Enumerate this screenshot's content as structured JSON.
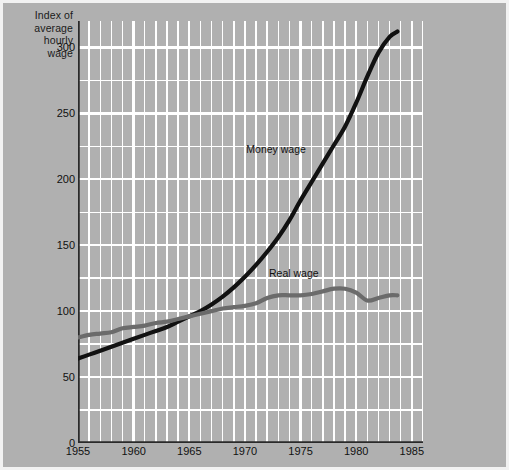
{
  "chart_data": {
    "type": "line",
    "title": "Index of average hourly wage",
    "xlabel": "",
    "ylabel": "Index of average hourly wage",
    "xlim": [
      1955,
      1986
    ],
    "ylim": [
      0,
      320
    ],
    "yticks": [
      0,
      50,
      100,
      150,
      200,
      250,
      300
    ],
    "xticks": [
      1955,
      1960,
      1965,
      1970,
      1975,
      1980,
      1985
    ],
    "grid": true,
    "grid_color": "#ffffff",
    "plot_background": "#b0b0b0",
    "legend": "inline-annotations",
    "annotations": [
      {
        "text": "Money wage",
        "x": 1973.0,
        "y": 222
      },
      {
        "text": "Real wage",
        "x": 1974.5,
        "y": 128
      }
    ],
    "series": [
      {
        "name": "Money wage",
        "color": "#111111",
        "width": 4.2,
        "x": [
          1955,
          1956,
          1957,
          1958,
          1959,
          1960,
          1961,
          1962,
          1963,
          1964,
          1965,
          1966,
          1967,
          1968,
          1969,
          1970,
          1971,
          1972,
          1973,
          1974,
          1975,
          1976,
          1977,
          1978,
          1979,
          1980,
          1981,
          1982,
          1983,
          1983.7
        ],
        "values": [
          64,
          67,
          70,
          73,
          76,
          79,
          82,
          85,
          88,
          92,
          96,
          100,
          105,
          111,
          118,
          126,
          135,
          145,
          156,
          169,
          184,
          198,
          212,
          226,
          240,
          258,
          278,
          296,
          308,
          312
        ]
      },
      {
        "name": "Real wage",
        "color": "#6b6b6b",
        "width": 4.2,
        "x": [
          1955,
          1956,
          1957,
          1958,
          1959,
          1960,
          1961,
          1962,
          1963,
          1964,
          1965,
          1966,
          1967,
          1968,
          1969,
          1970,
          1971,
          1972,
          1973,
          1974,
          1975,
          1976,
          1977,
          1978,
          1979,
          1980,
          1981,
          1982,
          1983,
          1983.7
        ],
        "values": [
          80,
          82,
          83,
          84,
          87,
          88,
          89,
          91,
          92,
          94,
          96,
          98,
          100,
          102,
          103,
          104,
          106,
          110,
          112,
          112,
          112,
          113,
          115,
          117,
          117,
          114,
          108,
          110,
          112,
          112
        ]
      }
    ]
  },
  "axis_title_text": "Index of\naverage\nhourly\nwage",
  "ytick_labels": [
    "300",
    "250",
    "200",
    "150",
    "100",
    "50",
    "0"
  ],
  "xtick_labels": [
    "1955",
    "1960",
    "1965",
    "1970",
    "1975",
    "1980",
    "1985"
  ],
  "series_labels": {
    "money": "Money wage",
    "real": "Real wage"
  }
}
